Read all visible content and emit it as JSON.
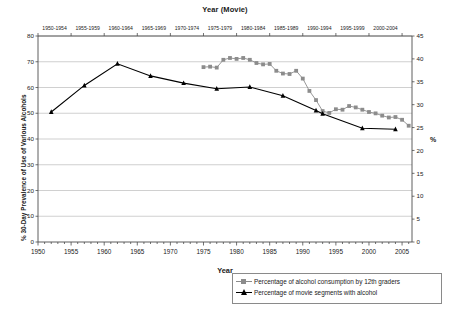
{
  "chart_data": {
    "type": "line",
    "title": "",
    "top_axis": {
      "label": "Year (Movie)",
      "ticks": [
        "1950-1954",
        "1955-1959",
        "1960-1964",
        "1965-1969",
        "1970-1974",
        "1975-1979",
        "1980-1984",
        "1985-1989",
        "1990-1994",
        "1995-1999",
        "2000-2004"
      ]
    },
    "xlabel": "Year",
    "xlim": [
      1950,
      2006.5
    ],
    "xticks": [
      1950,
      1955,
      1960,
      1965,
      1970,
      1975,
      1980,
      1985,
      1990,
      1995,
      2000,
      2005
    ],
    "xminor_step": 1,
    "ylabel_left": "% 30-Day Prevalence of Use of Various Alcohols",
    "ylim_left": [
      0,
      80
    ],
    "yticks_left": [
      0,
      10,
      20,
      30,
      40,
      50,
      60,
      70,
      80
    ],
    "ylabel_right": "%",
    "ylim_right": [
      0,
      45
    ],
    "yticks_right": [
      0,
      5,
      10,
      15,
      20,
      25,
      30,
      35,
      40,
      45
    ],
    "grid": "horizontal",
    "legend_position": "bottom-right",
    "series": [
      {
        "name": "Percentage of alcohol consumption by 12th graders",
        "axis": "right",
        "marker": "square",
        "color": "#8c8c8c",
        "points": [
          [
            1975,
            38.2
          ],
          [
            1976,
            38.3
          ],
          [
            1977,
            38.1
          ],
          [
            1978,
            39.8
          ],
          [
            1979,
            40.2
          ],
          [
            1980,
            40.0
          ],
          [
            1981,
            40.2
          ],
          [
            1982,
            39.8
          ],
          [
            1983,
            39.1
          ],
          [
            1984,
            38.8
          ],
          [
            1985,
            38.9
          ],
          [
            1986,
            37.4
          ],
          [
            1987,
            36.8
          ],
          [
            1988,
            36.7
          ],
          [
            1989,
            37.4
          ],
          [
            1990,
            35.7
          ],
          [
            1991,
            33.0
          ],
          [
            1992,
            31.0
          ],
          [
            1993,
            28.6
          ],
          [
            1994,
            28.2
          ],
          [
            1995,
            29.0
          ],
          [
            1996,
            28.9
          ],
          [
            1997,
            29.7
          ],
          [
            1998,
            29.4
          ],
          [
            1999,
            28.9
          ],
          [
            2000,
            28.4
          ],
          [
            2001,
            28.1
          ],
          [
            2002,
            27.6
          ],
          [
            2003,
            27.2
          ],
          [
            2004,
            27.3
          ],
          [
            2005,
            26.7
          ],
          [
            2006,
            25.4
          ]
        ]
      },
      {
        "name": "Percentage of movie segments with alcohol",
        "axis": "left",
        "marker": "triangle",
        "color": "#000000",
        "points": [
          [
            1952,
            50.5
          ],
          [
            1957,
            60.8
          ],
          [
            1962,
            69.2
          ],
          [
            1967,
            64.5
          ],
          [
            1972,
            61.7
          ],
          [
            1977,
            59.5
          ],
          [
            1982,
            60.2
          ],
          [
            1987,
            56.8
          ],
          [
            1992,
            51.1
          ],
          [
            1993,
            49.8
          ],
          [
            1999,
            44.2
          ],
          [
            2004,
            43.8
          ]
        ]
      }
    ]
  }
}
